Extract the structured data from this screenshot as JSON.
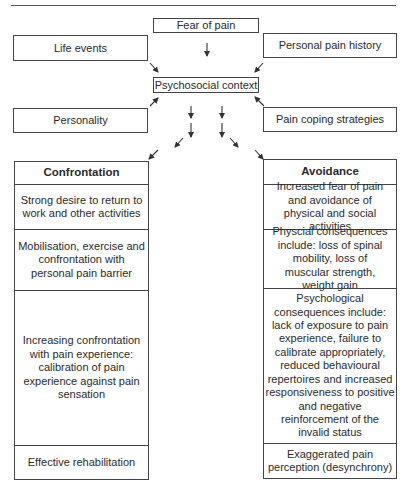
{
  "diagram": {
    "factors": {
      "fear_of_pain": "Fear of pain",
      "life_events": "Life events",
      "personal_pain_history": "Personal pain history",
      "psychosocial_context": "Psychosocial context",
      "personality": "Personality",
      "pain_coping_strategies": "Pain coping strategies"
    },
    "confrontation": {
      "title": "Confrontation",
      "steps": [
        "Strong desire to return to work and other activities",
        "Mobilisation, exercise and confrontation with personal pain barrier",
        "Increasing confrontation with pain experience: calibration of pain experience against pain sensation",
        "Effective rehabilitation"
      ]
    },
    "avoidance": {
      "title": "Avoidance",
      "steps": [
        "Increased fear of pain and avoidance of physical and social activities",
        "Physcial consequences include: loss of spinal mobility, loss of muscular strength, weight gain",
        "Psychological consequences include: lack of exposure to pain experience, failure to calibrate appropriately, reduced behavioural repertoires and increased responsiveness to positive and negative reinforcement of the invalid status",
        "Exaggerated pain perception (desynchrony)"
      ]
    },
    "connections": [
      {
        "from": "Fear of pain",
        "to": "Psychosocial context"
      },
      {
        "from": "Life events",
        "to": "Psychosocial context"
      },
      {
        "from": "Personal pain history",
        "to": "Psychosocial context"
      },
      {
        "from": "Personality",
        "to": "Psychosocial context"
      },
      {
        "from": "Pain coping strategies",
        "to": "Psychosocial context"
      },
      {
        "from": "Psychosocial context",
        "to": "Confrontation"
      },
      {
        "from": "Psychosocial context",
        "to": "Avoidance"
      }
    ],
    "colors": {
      "line": "#444444",
      "text": "#2b2b2b",
      "background": "#ffffff"
    }
  }
}
